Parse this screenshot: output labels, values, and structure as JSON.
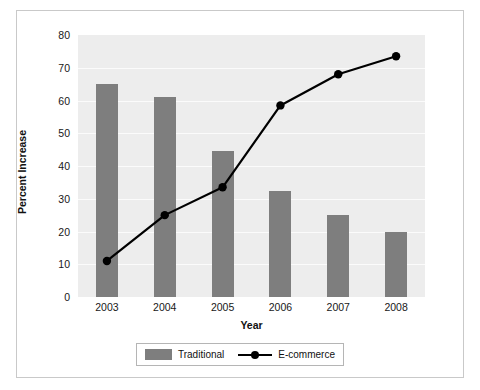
{
  "chart_data": {
    "type": "bar",
    "title": "",
    "xlabel": "Year",
    "ylabel": "Percent Increase",
    "categories": [
      "2003",
      "2004",
      "2005",
      "2006",
      "2007",
      "2008"
    ],
    "ylim": [
      0,
      80
    ],
    "yticks": [
      0,
      10,
      20,
      30,
      40,
      50,
      60,
      70,
      80
    ],
    "ytick_labels": [
      "0",
      "10",
      "20",
      "30",
      "40",
      "50",
      "60",
      "70",
      "80"
    ],
    "grid": true,
    "legend_position": "bottom-center",
    "series": [
      {
        "name": "Traditional",
        "type": "bar",
        "color": "#7e7e7e",
        "values": [
          65,
          61,
          44.5,
          32.5,
          25,
          20
        ]
      },
      {
        "name": "E-commerce",
        "type": "line",
        "color": "#000000",
        "marker": "circle",
        "values": [
          11,
          25,
          33.5,
          58.5,
          68,
          73.5
        ]
      }
    ]
  },
  "axes": {
    "x_title": "Year",
    "y_title": "Percent Increase"
  },
  "legend": {
    "items": [
      {
        "label": "Traditional",
        "icon": "bar-swatch-icon"
      },
      {
        "label": "E-commerce",
        "icon": "line-marker-icon"
      }
    ]
  },
  "colors": {
    "bar": "#7e7e7e",
    "line": "#000000",
    "plot_background": "#ededed",
    "gridline": "#fbfbfb",
    "frame_border": "#c9c9c9",
    "page_background": "#ffffff"
  }
}
